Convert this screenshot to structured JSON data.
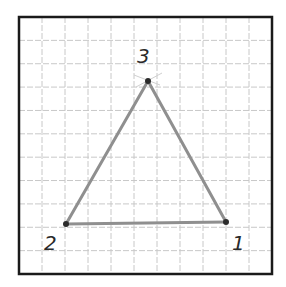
{
  "diagram": {
    "type": "triangle-on-grid",
    "frame": {
      "x": 19,
      "y": 17,
      "width": 253,
      "height": 257,
      "stroke": "#1a1a1a"
    },
    "grid": {
      "spacing": 23,
      "color": "#c8c8c8",
      "origin_x": 20,
      "origin_y": 17,
      "cols": 11,
      "rows": 11
    },
    "edge_color": "#8f8f8f",
    "vertex_color": "#2b2b2b",
    "vertices": [
      {
        "id": "1",
        "label": "1",
        "x": 226,
        "y": 222,
        "label_x": 232,
        "label_y": 250
      },
      {
        "id": "2",
        "label": "2",
        "x": 66,
        "y": 224,
        "label_x": 44,
        "label_y": 250
      },
      {
        "id": "3",
        "label": "3",
        "x": 148,
        "y": 81,
        "label_x": 137,
        "label_y": 63
      }
    ],
    "edges": [
      [
        "3",
        "2"
      ],
      [
        "2",
        "1"
      ],
      [
        "1",
        "3"
      ]
    ]
  }
}
